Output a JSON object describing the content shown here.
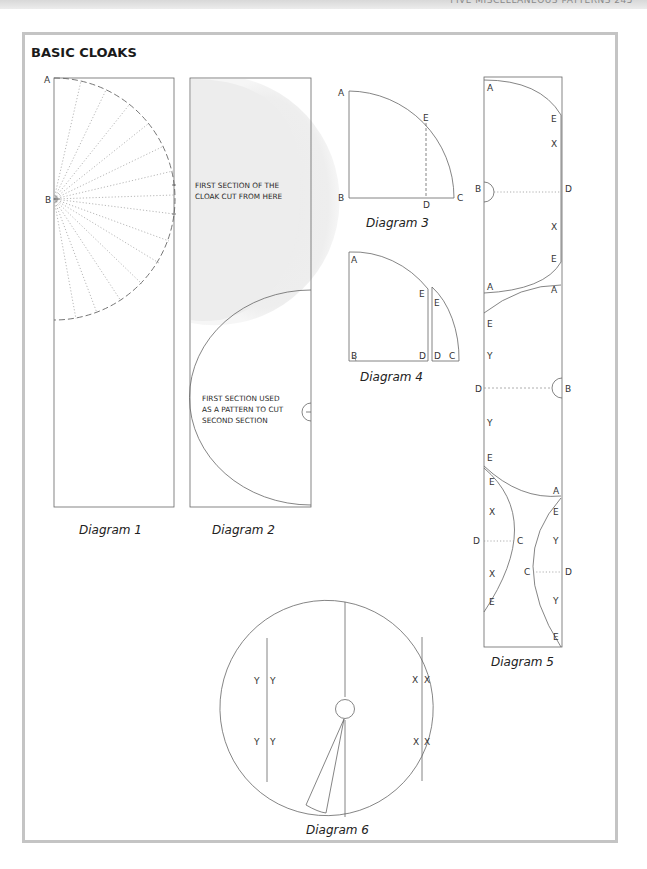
{
  "page": {
    "running_head": "FIVE MISCELLANEOUS PATTERNS 245",
    "section_title": "BASIC CLOAKS"
  },
  "diagrams": {
    "d1": {
      "caption": "Diagram 1",
      "labels": {
        "a": "A",
        "b": "B"
      }
    },
    "d2": {
      "caption": "Diagram 2",
      "note_top": [
        "FIRST SECTION OF THE",
        "CLOAK CUT FROM HERE"
      ],
      "note_bottom": [
        "FIRST SECTION USED",
        "AS A PATTERN TO CUT",
        "SECOND SECTION"
      ]
    },
    "d3": {
      "caption": "Diagram 3",
      "labels": {
        "a": "A",
        "b": "B",
        "c": "C",
        "d": "D",
        "e": "E"
      }
    },
    "d4": {
      "caption": "Diagram 4",
      "labels": {
        "a": "A",
        "b": "B",
        "d1": "D",
        "e1": "E",
        "e2": "E",
        "d2": "D",
        "c": "C"
      }
    },
    "d5": {
      "caption": "Diagram 5",
      "top": {
        "a1": "A",
        "e1": "E",
        "x1": "X",
        "b": "B",
        "d": "D",
        "x2": "X",
        "e2": "E",
        "a2": "A"
      },
      "middle": {
        "a1": "A",
        "e1": "E",
        "y1": "Y",
        "d": "D",
        "b": "B",
        "y2": "Y",
        "e2": "E"
      },
      "bottom": {
        "e0": "E",
        "e1": "E",
        "x1": "X",
        "d1": "D",
        "c1": "C",
        "x2": "X",
        "e2": "E",
        "a": "A",
        "e3": "E",
        "y1": "Y",
        "c2": "C",
        "d2": "D",
        "y2": "Y",
        "e4": "E"
      }
    },
    "d6": {
      "caption": "Diagram 6",
      "labels": {
        "y1": "Y",
        "y2": "Y",
        "y3": "Y",
        "y4": "Y",
        "x1": "X",
        "x2": "X",
        "x3": "X",
        "x4": "X"
      }
    }
  },
  "colors": {
    "line": "#6a6a6a",
    "frame": "#c4c4c4",
    "shade": "#ececec"
  }
}
